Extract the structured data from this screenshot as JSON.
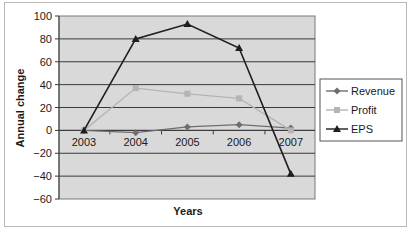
{
  "chart_data": {
    "type": "line",
    "title": "",
    "xlabel": "Years",
    "ylabel": "Annual change",
    "categories": [
      "2003",
      "2004",
      "2005",
      "2006",
      "2007"
    ],
    "ylim": [
      -60,
      100
    ],
    "yticks": [
      100,
      80,
      60,
      40,
      20,
      0,
      -20,
      -40,
      -60
    ],
    "ytick_labels": [
      "100",
      "80",
      "60",
      "40",
      "20",
      "0",
      "−20",
      "−40",
      "−60"
    ],
    "grid": true,
    "legend_position": "right",
    "series": [
      {
        "name": "Revenue",
        "marker": "diamond",
        "color": "#6e6e6e",
        "values": [
          0,
          -2,
          3,
          5,
          2
        ]
      },
      {
        "name": "Profit",
        "marker": "square",
        "color": "#b4b4b4",
        "values": [
          0,
          37,
          32,
          28,
          0
        ]
      },
      {
        "name": "EPS",
        "marker": "triangle",
        "color": "#1e1e1e",
        "values": [
          0,
          80,
          93,
          72,
          -38
        ]
      }
    ]
  }
}
